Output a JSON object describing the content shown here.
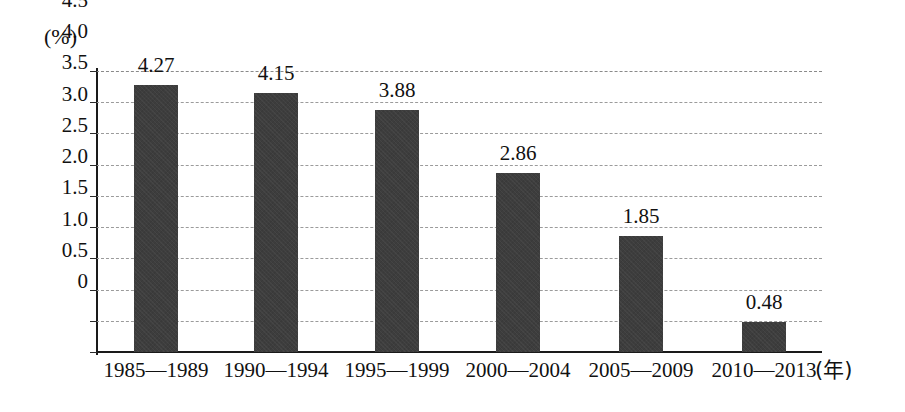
{
  "chart_data": {
    "type": "bar",
    "title": "",
    "subtitle": "",
    "xlabel": "年",
    "ylabel": "",
    "yunit": "(%)",
    "xunit_label": "(年)",
    "categories": [
      "1985—1989",
      "1990—1994",
      "1995—1999",
      "2000—2004",
      "2005—2009",
      "2010—2013"
    ],
    "values": [
      4.27,
      4.15,
      3.88,
      2.86,
      1.85,
      0.48
    ],
    "value_labels": [
      "4.27",
      "4.15",
      "3.88",
      "2.86",
      "1.85",
      "0.48"
    ],
    "ylim": [
      0,
      4.5
    ],
    "yticks": [
      0,
      0.5,
      1.0,
      1.5,
      2.0,
      2.5,
      3.0,
      3.5,
      4.0,
      4.5
    ],
    "ytick_labels": [
      "0",
      "0.5",
      "1.0",
      "1.5",
      "2.0",
      "2.5",
      "3.0",
      "3.5",
      "4.0",
      "4.5"
    ],
    "grid": true,
    "grid_style": "dashed",
    "legend": false,
    "legend_position": "none",
    "series": [
      {
        "name": "",
        "values": [
          4.27,
          4.15,
          3.88,
          2.86,
          1.85,
          0.48
        ],
        "color": "#3d3d3d"
      }
    ],
    "colors": {
      "bar": "#3d3d3d",
      "axis": "#1a1a1a",
      "grid": "#9b9b9b",
      "text": "#111111",
      "background": "#ffffff"
    }
  }
}
